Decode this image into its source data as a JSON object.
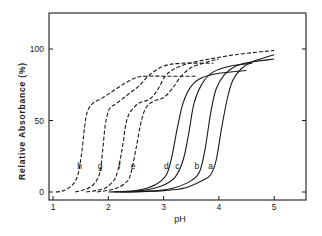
{
  "chart_data": {
    "type": "line",
    "title": "",
    "xlabel": "pH",
    "ylabel": "Relative Absorbance (%)",
    "xlim": [
      0.95,
      5.6
    ],
    "ylim": [
      -5,
      125
    ],
    "xticks": [
      1,
      2,
      3,
      4,
      5
    ],
    "yticks": [
      0,
      50,
      100
    ],
    "grid": false,
    "legend": "inline curve labels",
    "series": [
      {
        "name": "a",
        "style": "solid",
        "label_pos": [
          3.85,
          18
        ],
        "points": [
          [
            2.3,
            0
          ],
          [
            3.0,
            1
          ],
          [
            3.4,
            3
          ],
          [
            3.7,
            8
          ],
          [
            3.85,
            12
          ],
          [
            3.95,
            22
          ],
          [
            4.05,
            45
          ],
          [
            4.15,
            65
          ],
          [
            4.25,
            78
          ],
          [
            4.4,
            86
          ],
          [
            4.6,
            91
          ],
          [
            5.0,
            96
          ],
          [
            5.6,
            100
          ]
        ]
      },
      {
        "name": "b",
        "style": "solid",
        "label_pos": [
          3.6,
          18
        ],
        "points": [
          [
            2.2,
            0
          ],
          [
            2.9,
            1
          ],
          [
            3.2,
            3
          ],
          [
            3.5,
            8
          ],
          [
            3.65,
            14
          ],
          [
            3.75,
            30
          ],
          [
            3.85,
            55
          ],
          [
            3.95,
            72
          ],
          [
            4.1,
            82
          ],
          [
            4.3,
            88
          ],
          [
            4.6,
            91
          ],
          [
            5.0,
            93
          ],
          [
            5.6,
            95
          ]
        ]
      },
      {
        "name": "c",
        "style": "solid",
        "label_pos": [
          3.25,
          18
        ],
        "points": [
          [
            2.1,
            0
          ],
          [
            2.6,
            1
          ],
          [
            2.95,
            4
          ],
          [
            3.2,
            10
          ],
          [
            3.35,
            22
          ],
          [
            3.45,
            40
          ],
          [
            3.55,
            62
          ],
          [
            3.7,
            76
          ],
          [
            3.9,
            84
          ],
          [
            4.2,
            88
          ],
          [
            4.6,
            90
          ],
          [
            5.6,
            90
          ]
        ]
      },
      {
        "name": "d",
        "style": "solid",
        "label_pos": [
          3.05,
          18
        ],
        "points": [
          [
            2.0,
            0
          ],
          [
            2.5,
            1
          ],
          [
            2.85,
            5
          ],
          [
            3.05,
            12
          ],
          [
            3.15,
            25
          ],
          [
            3.25,
            45
          ],
          [
            3.35,
            62
          ],
          [
            3.5,
            74
          ],
          [
            3.7,
            80
          ],
          [
            4.0,
            83
          ],
          [
            4.5,
            85
          ],
          [
            5.6,
            85
          ]
        ]
      },
      {
        "name": "e",
        "style": "dashed",
        "label_pos": [
          2.45,
          18
        ],
        "points": [
          [
            1.8,
            0
          ],
          [
            2.1,
            2
          ],
          [
            2.3,
            6
          ],
          [
            2.4,
            12
          ],
          [
            2.5,
            30
          ],
          [
            2.6,
            50
          ],
          [
            2.7,
            60
          ],
          [
            2.85,
            64
          ],
          [
            3.0,
            66
          ],
          [
            3.15,
            72
          ],
          [
            3.3,
            80
          ],
          [
            3.5,
            87
          ],
          [
            3.8,
            91
          ],
          [
            4.0,
            93
          ]
        ]
      },
      {
        "name": "f",
        "style": "dashed",
        "label_pos": [
          2.2,
          18
        ],
        "points": [
          [
            1.6,
            0
          ],
          [
            1.9,
            2
          ],
          [
            2.05,
            6
          ],
          [
            2.15,
            12
          ],
          [
            2.25,
            30
          ],
          [
            2.32,
            48
          ],
          [
            2.4,
            56
          ],
          [
            2.55,
            62
          ],
          [
            2.75,
            65
          ],
          [
            2.9,
            72
          ],
          [
            3.05,
            82
          ],
          [
            3.3,
            88
          ],
          [
            3.7,
            92
          ],
          [
            4.3,
            96
          ],
          [
            5.0,
            99
          ],
          [
            5.6,
            100
          ]
        ]
      },
      {
        "name": "g",
        "style": "dashed",
        "label_pos": [
          1.85,
          18
        ],
        "points": [
          [
            1.4,
            0
          ],
          [
            1.6,
            2
          ],
          [
            1.75,
            6
          ],
          [
            1.85,
            14
          ],
          [
            1.9,
            30
          ],
          [
            1.95,
            48
          ],
          [
            2.02,
            58
          ],
          [
            2.15,
            62
          ],
          [
            2.35,
            68
          ],
          [
            2.55,
            74
          ],
          [
            2.75,
            82
          ],
          [
            3.0,
            88
          ],
          [
            3.3,
            90
          ],
          [
            3.9,
            90
          ]
        ]
      },
      {
        "name": "h",
        "style": "dashed",
        "label_pos": [
          1.48,
          18
        ],
        "points": [
          [
            1.05,
            0
          ],
          [
            1.2,
            1
          ],
          [
            1.35,
            5
          ],
          [
            1.45,
            12
          ],
          [
            1.52,
            28
          ],
          [
            1.57,
            45
          ],
          [
            1.62,
            56
          ],
          [
            1.72,
            62
          ],
          [
            1.9,
            66
          ],
          [
            2.1,
            71
          ],
          [
            2.3,
            76
          ],
          [
            2.5,
            80
          ],
          [
            2.7,
            81
          ],
          [
            3.0,
            81
          ],
          [
            3.6,
            81
          ]
        ]
      }
    ]
  }
}
